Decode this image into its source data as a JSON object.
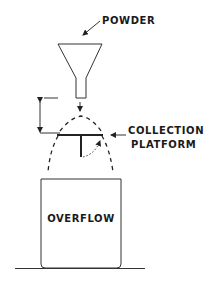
{
  "diagram": {
    "labels": {
      "powder": "POWDER",
      "collection_line1": "COLLECTION",
      "collection_line2": "PLATFORM",
      "overflow": "OVERFLOW"
    },
    "colors": {
      "ink": "#222222",
      "background": "#ffffff"
    },
    "components": [
      "powder-funnel",
      "drop-height-dimension",
      "powder-cone",
      "collection-platform",
      "overflow-container",
      "ground-line"
    ]
  }
}
